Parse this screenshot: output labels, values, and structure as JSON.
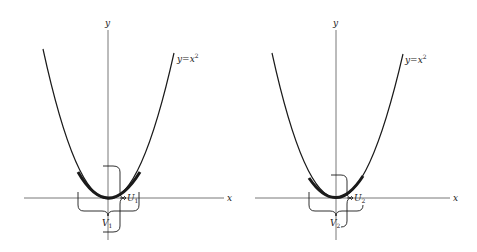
{
  "figures": [
    {
      "id": "left",
      "axis_x_label": "x",
      "axis_y_label": "y",
      "curve_label": "y = x²",
      "curve_label_base": "y=x",
      "curve_label_exp": "2",
      "neighborhood_U": "U",
      "neighborhood_U_sub": "1",
      "neighborhood_V": "V",
      "neighborhood_V_sub": "1"
    },
    {
      "id": "right",
      "axis_x_label": "x",
      "axis_y_label": "y",
      "curve_label": "y = x²",
      "curve_label_base": "y=x",
      "curve_label_exp": "2",
      "neighborhood_U": "U",
      "neighborhood_U_sub": "2",
      "neighborhood_V": "V",
      "neighborhood_V_sub": "2"
    }
  ],
  "colors": {
    "ink": "#1a1a1a",
    "axis": "#555555",
    "background": "#ffffff"
  }
}
